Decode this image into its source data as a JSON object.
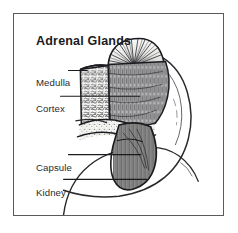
{
  "figure": {
    "title": "Adrenal Glands",
    "frame_color": "#5a5a5e",
    "background_color": "#ffffff",
    "ink_color": "#1b1b1f",
    "labels": [
      {
        "id": "medulla",
        "text": "Medulla"
      },
      {
        "id": "cortex",
        "text": "Cortex"
      },
      {
        "id": "capsule",
        "text": "Capsule"
      },
      {
        "id": "kidney",
        "text": "Kidney"
      }
    ],
    "structures": [
      "adrenal-gland-cross-section",
      "adrenal-medulla",
      "adrenal-cortex",
      "adrenal-capsule",
      "kidney"
    ]
  }
}
